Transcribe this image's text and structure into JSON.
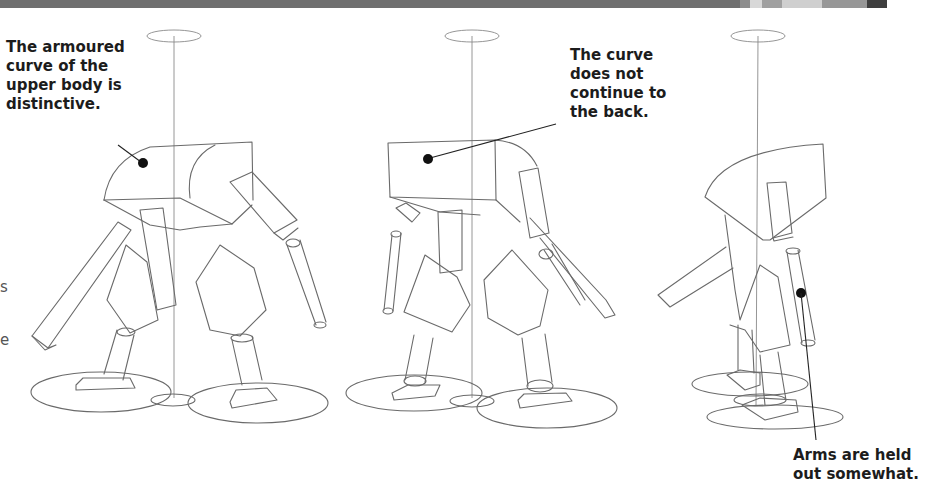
{
  "banner": {
    "segments": [
      {
        "color": "#6f6f6f",
        "width": 740
      },
      {
        "color": "#8d8d8d",
        "width": 10
      },
      {
        "color": "#d8d8d8",
        "width": 12
      },
      {
        "color": "#a0a0a0",
        "width": 20
      },
      {
        "color": "#cfcfcf",
        "width": 40
      },
      {
        "color": "#979797",
        "width": 45
      },
      {
        "color": "#3f3f3f",
        "width": 20
      },
      {
        "color": "#ffffff",
        "width": 41
      }
    ]
  },
  "annotations": {
    "front_view": "The armoured\ncurve of the\nupper body is\ndistinctive.",
    "three_quarter_view": "The curve\ndoes not\ncontinue to\nthe back.",
    "side_view": "Arms are held\nout somewhat."
  },
  "left_margin_fragments": [
    "s",
    "e"
  ],
  "figures": [
    {
      "name": "front-three-quarter-robot"
    },
    {
      "name": "rear-three-quarter-robot"
    },
    {
      "name": "side-view-robot"
    }
  ]
}
